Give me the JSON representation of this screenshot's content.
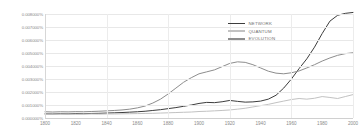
{
  "chart_data": {
    "type": "line",
    "title": "",
    "xlabel": "",
    "ylabel": "",
    "xlim": [
      1800,
      2000
    ],
    "ylim": [
      0.0,
      0.008
    ],
    "grid": true,
    "legend_position": "top-right",
    "xticks": [
      "1800",
      "1820",
      "1840",
      "1860",
      "1880",
      "1900",
      "1920",
      "1940",
      "1960",
      "1980",
      "2000"
    ],
    "yticks": [
      "0.000000%",
      "0.001000%",
      "0.002000%",
      "0.003000%",
      "0.004000%",
      "0.005000%",
      "0.006000%",
      "0.007000%",
      "0.008000%"
    ],
    "x": [
      1800,
      1805,
      1810,
      1815,
      1820,
      1825,
      1830,
      1835,
      1840,
      1845,
      1850,
      1855,
      1860,
      1865,
      1870,
      1875,
      1880,
      1885,
      1890,
      1895,
      1900,
      1905,
      1910,
      1915,
      1920,
      1925,
      1930,
      1935,
      1940,
      1945,
      1950,
      1955,
      1960,
      1965,
      1970,
      1975,
      1980,
      1985,
      1990,
      1995,
      2000
    ],
    "series": [
      {
        "name": "NETWORK",
        "color": "#3d3d3d",
        "values": [
          0.00032,
          0.00031,
          0.00033,
          0.00032,
          0.00034,
          0.00033,
          0.00035,
          0.00036,
          0.00038,
          0.0004,
          0.00042,
          0.00045,
          0.00048,
          0.00052,
          0.00058,
          0.00064,
          0.00072,
          0.0008,
          0.0009,
          0.001,
          0.00112,
          0.0012,
          0.00118,
          0.00125,
          0.00135,
          0.00128,
          0.00122,
          0.00124,
          0.0013,
          0.00145,
          0.00175,
          0.0023,
          0.003,
          0.0038,
          0.00455,
          0.00545,
          0.0065,
          0.00745,
          0.0079,
          0.00805,
          0.00812
        ]
      },
      {
        "name": "QUANTUM",
        "color": "#c2c2c2",
        "values": [
          0.0003,
          0.00029,
          0.0003,
          0.0003,
          0.00029,
          0.0003,
          0.00031,
          0.0003,
          0.00031,
          0.00031,
          0.00032,
          0.00033,
          0.00034,
          0.00035,
          0.00036,
          0.00038,
          0.0004,
          0.00042,
          0.00044,
          0.00046,
          0.0005,
          0.00052,
          0.00055,
          0.00058,
          0.00062,
          0.00068,
          0.00075,
          0.00085,
          0.00095,
          0.00105,
          0.00118,
          0.0013,
          0.00142,
          0.0015,
          0.00145,
          0.00152,
          0.00165,
          0.00158,
          0.0015,
          0.00165,
          0.0018
        ]
      },
      {
        "name": "EVOLUTION",
        "color": "#8d8d8d",
        "values": [
          0.00048,
          0.00046,
          0.00048,
          0.00047,
          0.00049,
          0.00048,
          0.0005,
          0.00052,
          0.00055,
          0.00058,
          0.00062,
          0.00068,
          0.00078,
          0.00092,
          0.00115,
          0.00145,
          0.00185,
          0.0023,
          0.00275,
          0.0031,
          0.0034,
          0.00355,
          0.0037,
          0.00395,
          0.0042,
          0.00432,
          0.00428,
          0.0041,
          0.00385,
          0.0036,
          0.00345,
          0.0034,
          0.00348,
          0.00362,
          0.00385,
          0.0041,
          0.00438,
          0.00462,
          0.00482,
          0.00495,
          0.00502
        ]
      }
    ],
    "legend": [
      {
        "label": "NETWORK",
        "color": "#3d3d3d"
      },
      {
        "label": "QUANTUM",
        "color": "#c2c2c2"
      },
      {
        "label": "EVOLUTION",
        "color": "#8d8d8d"
      }
    ]
  }
}
